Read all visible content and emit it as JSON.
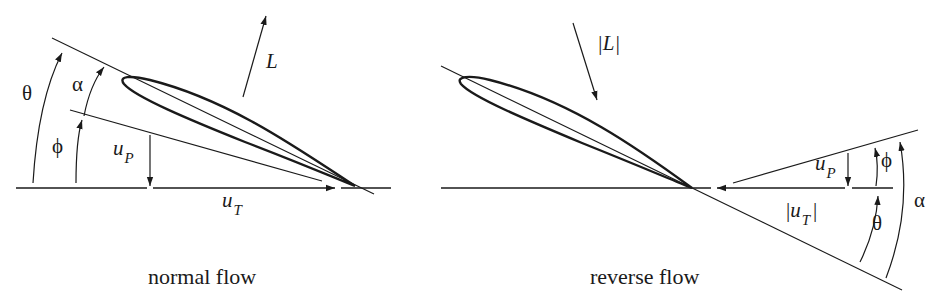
{
  "diagrams": [
    {
      "id": "normal",
      "caption": "normal flow",
      "labels": {
        "theta": "θ",
        "alpha": "α",
        "phi": "ϕ",
        "lift": "L",
        "up_main": "u",
        "up_sub": "P",
        "ut_main": "u",
        "ut_sub": "T"
      }
    },
    {
      "id": "reverse",
      "caption": "reverse flow",
      "labels": {
        "theta": "θ",
        "alpha": "α",
        "phi": "ϕ",
        "lift": "|L|",
        "up_main": "u",
        "up_sub": "P",
        "ut_pre": "|",
        "ut_main": "u",
        "ut_sub": "T",
        "ut_post": "|"
      }
    }
  ],
  "colors": {
    "stroke": "#1a1a1a",
    "background": "#ffffff"
  }
}
